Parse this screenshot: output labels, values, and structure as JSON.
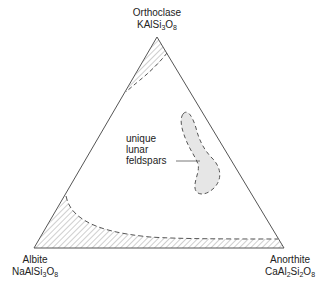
{
  "diagram": {
    "type": "ternary-phase-diagram",
    "vertices": {
      "top": {
        "name": "Orthoclase",
        "formula": [
          [
            "KAlSi",
            ""
          ],
          [
            "3",
            "sub"
          ],
          [
            "O",
            ""
          ],
          [
            "8",
            "sub"
          ]
        ]
      },
      "left": {
        "name": "Albite",
        "formula": [
          [
            "NaAlSi",
            ""
          ],
          [
            "3",
            "sub"
          ],
          [
            "O",
            ""
          ],
          [
            "8",
            "sub"
          ]
        ]
      },
      "right": {
        "name": "Anorthite",
        "formula": [
          [
            "CaAl",
            ""
          ],
          [
            "2",
            "sub"
          ],
          [
            "Si",
            ""
          ],
          [
            "2",
            "sub"
          ],
          [
            "O",
            ""
          ],
          [
            "8",
            "sub"
          ]
        ]
      }
    },
    "regions": [
      {
        "name": "orthoclase-field",
        "style": "hatched"
      },
      {
        "name": "albite-anorthite-field",
        "style": "hatched"
      },
      {
        "name": "unique-lunar-feldspars",
        "style": "stippled"
      }
    ],
    "annotation": {
      "lines": [
        "unique",
        "lunar",
        "feldspars"
      ]
    },
    "colors": {
      "line": "#555555",
      "hatch": "#888888",
      "fill": "#e6e6e6"
    }
  }
}
